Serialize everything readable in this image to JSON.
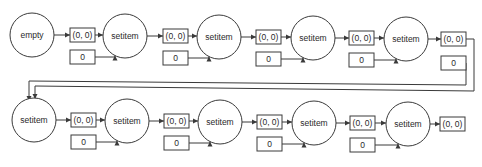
{
  "diagram": {
    "type": "flow",
    "rows": [
      {
        "nodes": [
          {
            "label": "empty",
            "cx": 32,
            "cy": 35
          },
          {
            "label": "setitem",
            "cx": 125,
            "cy": 36
          },
          {
            "label": "setitem",
            "cx": 219,
            "cy": 37
          },
          {
            "label": "setitem",
            "cx": 313,
            "cy": 38
          },
          {
            "label": "setitem",
            "cx": 406,
            "cy": 39
          }
        ],
        "key_boxes": [
          {
            "label": "(0, 0)",
            "x": 70,
            "y": 28
          },
          {
            "label": "(0, 0)",
            "x": 163,
            "y": 29
          },
          {
            "label": "(0, 0)",
            "x": 256,
            "y": 30
          },
          {
            "label": "(0, 0)",
            "x": 349,
            "y": 31
          },
          {
            "label": "(0, 0)",
            "x": 441,
            "y": 32
          }
        ],
        "value_boxes": [
          {
            "label": "0",
            "x": 70,
            "y": 50
          },
          {
            "label": "0",
            "x": 163,
            "y": 51
          },
          {
            "label": "0",
            "x": 256,
            "y": 52
          },
          {
            "label": "0",
            "x": 349,
            "y": 53
          },
          {
            "label": "0",
            "x": 441,
            "y": 56
          }
        ]
      },
      {
        "nodes": [
          {
            "label": "setitem",
            "cx": 34,
            "cy": 120
          },
          {
            "label": "setitem",
            "cx": 127,
            "cy": 121
          },
          {
            "label": "setitem",
            "cx": 220,
            "cy": 122
          },
          {
            "label": "setitem",
            "cx": 314,
            "cy": 123
          },
          {
            "label": "setitem",
            "cx": 408,
            "cy": 124
          }
        ],
        "key_boxes": [
          {
            "label": "(0, 0)",
            "x": 71,
            "y": 113
          },
          {
            "label": "(0, 0)",
            "x": 164,
            "y": 114
          },
          {
            "label": "(0, 0)",
            "x": 257,
            "y": 115
          },
          {
            "label": "(0, 0)",
            "x": 350,
            "y": 116
          },
          {
            "label": "(0, 0)",
            "x": 440,
            "y": 117
          }
        ],
        "value_boxes": [
          {
            "label": "0",
            "x": 71,
            "y": 135
          },
          {
            "label": "0",
            "x": 164,
            "y": 136
          },
          {
            "label": "0",
            "x": 257,
            "y": 137
          },
          {
            "label": "0",
            "x": 350,
            "y": 138
          }
        ]
      }
    ],
    "colors": {
      "stroke": "#3a3a3a",
      "text": "#2a2a2a",
      "background": "#ffffff"
    }
  }
}
